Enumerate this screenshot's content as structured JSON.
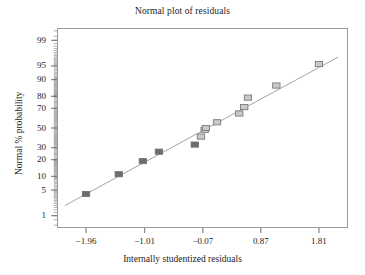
{
  "chart_data": {
    "type": "scatter",
    "title": "Normal plot of residuals",
    "xlabel": "Internally studentized residuals",
    "ylabel": "Normal % probability",
    "grid": false,
    "legend": null,
    "x_scale": "linear",
    "y_scale": "probit",
    "xlim": [
      -2.43,
      2.28
    ],
    "ylim_percent": [
      0.4,
      99.6
    ],
    "xticks": [
      -1.96,
      -1.01,
      -0.07,
      0.87,
      1.81
    ],
    "xtick_labels": [
      "−1.96",
      "−1.01",
      "−0.07",
      "0.87",
      "1.81"
    ],
    "yticks": [
      1,
      5,
      10,
      20,
      30,
      50,
      70,
      80,
      90,
      95,
      99
    ],
    "ytick_labels": [
      "1",
      "5",
      "10",
      "20",
      "30",
      "50",
      "70",
      "80",
      "90",
      "95",
      "99"
    ],
    "series": [
      {
        "name": "Residual points",
        "marker": "square",
        "x": [
          -1.96,
          -1.43,
          -1.04,
          -0.78,
          -0.2,
          -0.1,
          -0.04,
          -0.02,
          0.16,
          0.52,
          0.6,
          0.66,
          1.12,
          1.81
        ],
        "y_percent": [
          4.0,
          11.0,
          19.0,
          26.5,
          33.0,
          41.0,
          48.0,
          50.0,
          56.0,
          65.0,
          71.0,
          79.0,
          87.0,
          95.5
        ],
        "fill_by_index": [
          "dark",
          "dark",
          "dark",
          "dark",
          "dark",
          "light",
          "light",
          "light",
          "light",
          "light",
          "light",
          "light",
          "light",
          "light"
        ]
      }
    ],
    "reference_line": {
      "name": "normal reference line",
      "x_start": -2.3,
      "y_percent_start": 2.0,
      "x_end": 2.12,
      "y_percent_end": 97.0
    },
    "colors": {
      "frame": "#9a9a9a",
      "line": "#9b9b9b",
      "marker_dark_fill": "#6d6d6d",
      "marker_light_fill": "#c9c9c9",
      "marker_edge": "#6f6f6f",
      "text": "#1c1c1c",
      "background": "#ffffff"
    }
  }
}
